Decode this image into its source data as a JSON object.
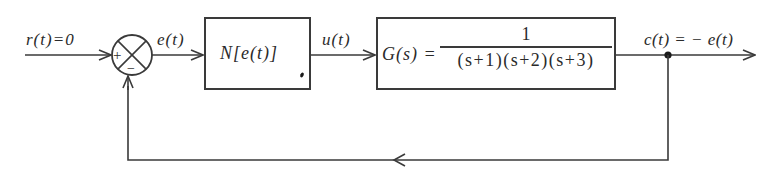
{
  "diagram": {
    "type": "block_diagram",
    "input": {
      "label": "r(t)=0",
      "var": "r",
      "arg": "t",
      "value": "0"
    },
    "summing_junction": {
      "plus_sign": "+",
      "minus_sign": "−"
    },
    "error_signal": {
      "label": "e(t)"
    },
    "nonlinear_block": {
      "label": "N[e(t)]"
    },
    "control_signal": {
      "label": "u(t)"
    },
    "plant_block": {
      "lhs": "G(s) =",
      "numerator": "1",
      "denominator": "(s+1)(s+2)(s+3)"
    },
    "output": {
      "label": "c(t) = − e(t)"
    },
    "feedback": {
      "type": "unity negative feedback"
    },
    "colors": {
      "line": "#3a3a3a",
      "text": "#2a2a2a",
      "background": "#ffffff"
    }
  }
}
